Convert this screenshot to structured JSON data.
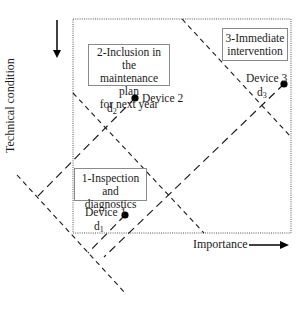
{
  "axes": {
    "x_label": "Importance",
    "y_label": "Technical condition",
    "x_arrow": "right",
    "y_arrow": "down"
  },
  "zones": [
    {
      "id": 1,
      "lines": [
        "1-Inspection",
        "and diagnostics"
      ]
    },
    {
      "id": 2,
      "lines": [
        "2-Inclusion in the",
        "maintenance plan",
        "for next year"
      ]
    },
    {
      "id": 3,
      "lines": [
        "3-Immediate",
        "intervention"
      ]
    }
  ],
  "devices": [
    {
      "label": "Device 1",
      "distance_label": "d",
      "distance_sub": "1"
    },
    {
      "label": "Device 2",
      "distance_label": "d",
      "distance_sub": "2"
    },
    {
      "label": "Device 3",
      "distance_label": "d",
      "distance_sub": "3"
    }
  ],
  "colors": {
    "line": "#1a1a1a",
    "frame": "#555555",
    "box_border": "#8a8a8a"
  }
}
